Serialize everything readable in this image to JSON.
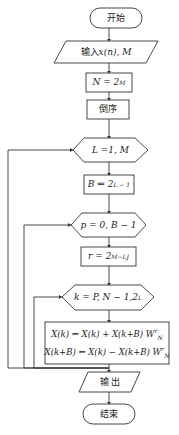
{
  "diagram": {
    "type": "flowchart",
    "nodes": [
      {
        "id": "start",
        "shape": "terminator",
        "label": "开始"
      },
      {
        "id": "input",
        "shape": "parallelogram",
        "label": "输入 x(n), M"
      },
      {
        "id": "n",
        "shape": "rectangle",
        "label": "N = 2^M"
      },
      {
        "id": "reorder",
        "shape": "rectangle",
        "label": "倒序"
      },
      {
        "id": "loopL",
        "shape": "hexagon",
        "label": "L = 1, M"
      },
      {
        "id": "b",
        "shape": "rectangle",
        "label": "B ⇐ 2^(L−1)"
      },
      {
        "id": "loopP",
        "shape": "hexagon",
        "label": "p = 0, B − 1"
      },
      {
        "id": "r",
        "shape": "rectangle",
        "label": "r = 2^(M−L) J"
      },
      {
        "id": "loopK",
        "shape": "hexagon",
        "label": "k = P, N − 1, 2^L"
      },
      {
        "id": "butterfly",
        "shape": "rectangle",
        "label": "X(k) ⇐ X(k) + X(k+B) W_N^r ; X(k+B) ⇐ X(k) − X(k+B) W_N^r"
      },
      {
        "id": "output",
        "shape": "parallelogram",
        "label": "输 出"
      },
      {
        "id": "end",
        "shape": "terminator",
        "label": "结束"
      }
    ],
    "edges": [
      [
        "start",
        "input"
      ],
      [
        "input",
        "n"
      ],
      [
        "n",
        "reorder"
      ],
      [
        "reorder",
        "loopL"
      ],
      [
        "loopL",
        "b"
      ],
      [
        "b",
        "loopP"
      ],
      [
        "loopP",
        "r"
      ],
      [
        "r",
        "loopK"
      ],
      [
        "loopK",
        "butterfly"
      ],
      [
        "butterfly",
        "loopK",
        "loop-back"
      ],
      [
        "butterfly",
        "loopP",
        "loop-back"
      ],
      [
        "butterfly",
        "loopL",
        "loop-back"
      ],
      [
        "butterfly",
        "output"
      ],
      [
        "output",
        "end"
      ]
    ]
  },
  "labels": {
    "start": "开始",
    "input_prefix": "输入 ",
    "input_x": "x",
    "input_n": "(n)",
    "input_m": ", M",
    "n_left": "N = 2",
    "n_sup": "M",
    "reorder": "倒序",
    "loopL": "L =1, M",
    "b_left": "B ⇐ 2",
    "b_sup": "L − 1",
    "loopP": "p = 0, B − 1",
    "r_left": "r = 2",
    "r_sup": "M−L",
    "r_right": "J",
    "k_left": "k = P, N − 1,2",
    "k_sup": "L",
    "bf_line1": "X(k) ⇐ X(k) + X(k+B) W",
    "bf_line2": "X(k+B) ⇐ X(k) − X(k+B) W",
    "bf_sup": "r",
    "bf_sub": "N",
    "output": "输 出",
    "end": "结束"
  }
}
